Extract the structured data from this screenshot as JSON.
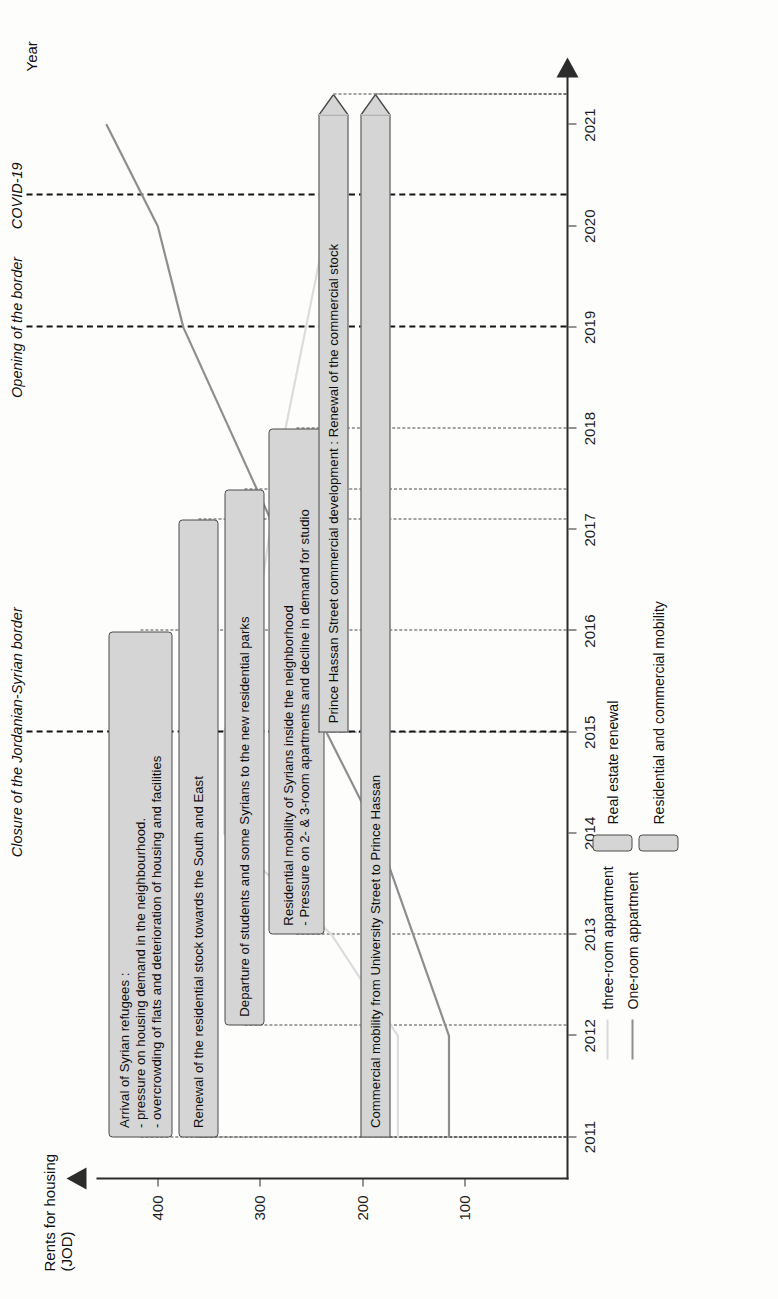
{
  "chart_data": {
    "type": "line",
    "title": "",
    "xlabel": "Year",
    "ylabel": "Rents for housing (JOD)",
    "x": [
      2011,
      2012,
      2013,
      2014,
      2015,
      2016,
      2017,
      2018,
      2019,
      2020,
      2021
    ],
    "xticks": [
      "2011",
      "2012",
      "2013",
      "2014",
      "2015",
      "2016",
      "2017",
      "2018",
      "2019",
      "2020",
      "2021"
    ],
    "yticks": [
      "100",
      "200",
      "300",
      "400"
    ],
    "ylim": [
      0,
      460
    ],
    "xlim": [
      2010.6,
      2021.4
    ],
    "grid": "horizontal-dashed",
    "legend_position": "below-axis-left",
    "series": [
      {
        "name": "three-room appartment",
        "color": "#dcdcdc",
        "values": [
          165,
          165,
          230,
          335,
          335,
          305,
          290,
          275,
          255,
          235,
          215
        ]
      },
      {
        "name": "One-room appartment",
        "color": "#8e8e8e",
        "values": [
          115,
          115,
          150,
          185,
          235,
          265,
          285,
          330,
          375,
          400,
          450
        ]
      }
    ],
    "events": [
      {
        "label": "Closure of the Jordanian-Syrian border",
        "year": 2015,
        "style": "dash-dot"
      },
      {
        "label": "Opening of the border",
        "year": 2019,
        "style": "dash-dot"
      },
      {
        "label": "COVID-19",
        "year": 2020.3,
        "style": "dash-dot"
      }
    ]
  },
  "annotations": [
    {
      "text": "Arrival of Syrian refugees :\n- pressure on housing demand in the neighbourhood.\n- overcrowding of flats and deterioration of housing and facilities",
      "start_year": 2011,
      "end_year": 2016,
      "track": 0,
      "type": "bar"
    },
    {
      "text": "Renewal of the residential stock towards the South and East",
      "start_year": 2011,
      "end_year": 2017.1,
      "track": 1,
      "type": "bar"
    },
    {
      "text": "Departure of students and some Syrians to the new residential parks",
      "start_year": 2012.1,
      "end_year": 2017.4,
      "track": 2,
      "type": "bar"
    },
    {
      "text": "Residential mobility of Syrians inside the neighborhood\n- Pressure on 2- & 3-room apartments and decline in demand for studio",
      "start_year": 2013,
      "end_year": 2018,
      "track": 3,
      "type": "bar"
    },
    {
      "text": "Prince Hassan Street commercial development : Renewal of the commercial stock",
      "start_year": 2015,
      "end_year": 2021.3,
      "track": 4,
      "type": "arrow"
    },
    {
      "text": "Commercial mobility from University Street to Prince Hassan",
      "start_year": 2011,
      "end_year": 2021.3,
      "track": 5,
      "type": "arrow"
    }
  ],
  "legend_boxes": [
    {
      "label": "Real estate renewal",
      "color": "#d5d5d5"
    },
    {
      "label": "Residential and commercial mobility",
      "color": "#d5d5d5"
    }
  ],
  "colors": {
    "axis": "#2b2b2b",
    "grid": "#4b4b4b",
    "annotation_fill": "#d5d5d5",
    "annotation_stroke": "#4a4a4a",
    "series_light": "#dcdcdc",
    "series_dark": "#8e8e8e"
  }
}
